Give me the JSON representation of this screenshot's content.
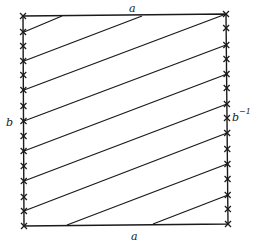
{
  "diagram": {
    "colors": {
      "stroke": "#1a1a1a",
      "background": "#ffffff"
    },
    "square": {
      "tl": [
        23,
        16
      ],
      "tr": [
        226,
        14
      ],
      "br": [
        228,
        224
      ],
      "bl": [
        24,
        226
      ]
    },
    "labels": {
      "top": "a",
      "bottom": "a",
      "left": "b",
      "right": "b",
      "right_superscript": "−1"
    },
    "label_positions": {
      "top": [
        129,
        12
      ],
      "bottom": [
        131,
        240
      ],
      "left": [
        6,
        126
      ],
      "right": [
        232,
        121
      ],
      "right_superscript": [
        239,
        114
      ]
    },
    "diagonals": [
      [
        [
          24,
          32
        ],
        [
          62,
          16
        ]
      ],
      [
        [
          24,
          61
        ],
        [
          142,
          16
        ]
      ],
      [
        [
          24,
          90
        ],
        [
          226,
          14
        ]
      ],
      [
        [
          24,
          121
        ],
        [
          226,
          45
        ]
      ],
      [
        [
          24,
          151
        ],
        [
          227,
          74
        ]
      ],
      [
        [
          24,
          181
        ],
        [
          227,
          104
        ]
      ],
      [
        [
          24,
          211
        ],
        [
          227,
          133
        ]
      ],
      [
        [
          67,
          225
        ],
        [
          227,
          164
        ]
      ],
      [
        [
          153,
          224
        ],
        [
          228,
          195
        ]
      ]
    ],
    "left_crosses_y": [
      16,
      32,
      46,
      61,
      75,
      90,
      106,
      121,
      136,
      151,
      166,
      181,
      197,
      211,
      226
    ],
    "right_crosses_y": [
      14,
      28,
      45,
      59,
      74,
      88,
      104,
      118,
      133,
      149,
      164,
      179,
      195,
      209,
      224
    ]
  }
}
